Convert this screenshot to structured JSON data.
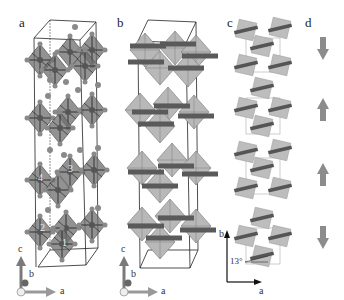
{
  "panels": {
    "a": {
      "label": "a",
      "site_labels": [
        "1",
        "2",
        "3",
        "4"
      ],
      "axes": [
        "c",
        "b",
        "a"
      ]
    },
    "b": {
      "label": "b",
      "axes": [
        "c",
        "b",
        "a"
      ]
    },
    "c": {
      "label": "c",
      "angle": "13°",
      "axes": [
        "b",
        "a"
      ]
    },
    "d": {
      "label": "d",
      "arrows": [
        "down",
        "up",
        "up",
        "down"
      ]
    }
  },
  "colors": {
    "octahedron_dark": "#6e6e6e",
    "octahedron_light": "#b8b8b8",
    "atom": "#8a8a8a",
    "cell_line": "#222222",
    "bar": "#5a5a5a",
    "arrow": "#8c8c8c"
  }
}
